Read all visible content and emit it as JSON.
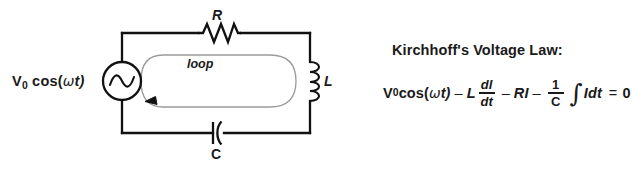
{
  "figure": {
    "background_color": "#ffffff",
    "wire_color": "#1a1a1a",
    "loop_color": "#9a9a9a",
    "text_color": "#1a1a1a"
  },
  "circuit": {
    "source": {
      "label_prefix": "V",
      "label_subscript": "0",
      "label_rest_open": " cos(",
      "label_omega": "ω",
      "label_rest_close": "t)",
      "symbol": "ac-source-sine"
    },
    "components": [
      {
        "id": "resistor",
        "label": "R",
        "symbol": "zigzag",
        "position": "top"
      },
      {
        "id": "inductor",
        "label": "L",
        "symbol": "coil",
        "position": "right"
      },
      {
        "id": "capacitor",
        "label": "C",
        "symbol": "polarized-plates",
        "position": "bottom"
      }
    ],
    "loop": {
      "label": "loop",
      "direction": "counterclockwise",
      "arrow": "arrowhead-left"
    }
  },
  "kvl": {
    "title": "Kirchhoff's Voltage Law:",
    "equation_plain": "V₀ cos(ωt) − L dI/dt − RI − (1/C) ∫I dt = 0",
    "terms": {
      "v_symbol": "V",
      "v_subscript": "0",
      "cos_open": " cos(",
      "omega": "ω",
      "cos_close": "t)",
      "minus1": "–",
      "inductance": "L",
      "frac1_num": "dI",
      "frac1_den": "dt",
      "minus2": "–",
      "resistive": "RI",
      "minus3": "–",
      "frac2_num": "1",
      "frac2_den": "C",
      "integral": "∫",
      "integrand": "Idt",
      "equals": "=",
      "zero": "0"
    }
  }
}
